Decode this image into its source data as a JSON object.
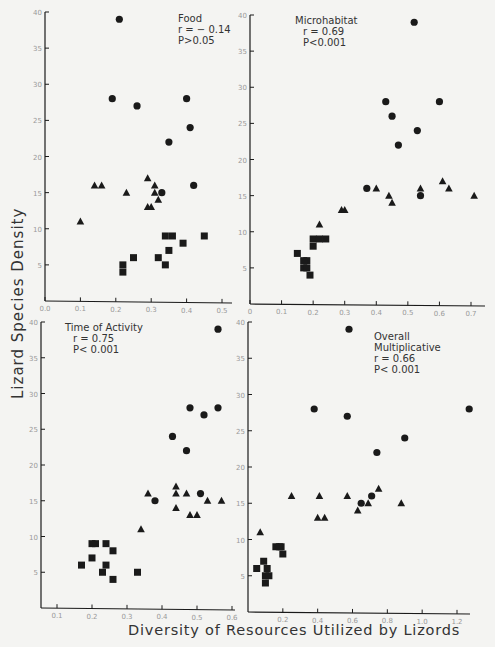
{
  "figure": {
    "ylabel": "Lizard Species Density",
    "xlabel": "Diversity of Resources Utilized by Lizords"
  },
  "chart_data": [
    {
      "type": "scatter",
      "title": "Food",
      "annotation": [
        "Food",
        "r = − 0.14",
        "P>0.05"
      ],
      "xlabel": "Diversity of Resources Utilized by Lizords",
      "ylabel": "Lizard Species Density",
      "xlim": [
        0.0,
        0.52
      ],
      "ylim": [
        0,
        40
      ],
      "xticks": [
        0.0,
        0.1,
        0.2,
        0.3,
        0.4,
        0.5
      ],
      "xtick_labels": [
        "0.0",
        "0.1",
        "0.2",
        "0.3",
        "0.4",
        "0.5"
      ],
      "yticks": [
        5,
        10,
        15,
        20,
        25,
        30,
        35,
        40
      ],
      "px": {
        "x0": 45,
        "x1": 222,
        "xv0": 0.0,
        "xv1": 0.5,
        "y0": 301,
        "y1": 12,
        "yv0": 0,
        "yv1": 40,
        "xend": 232
      },
      "annot_pos": [
        178,
        22
      ],
      "series": [
        {
          "name": "circles",
          "marker": "circle",
          "points": [
            [
              0.21,
              39
            ],
            [
              0.19,
              28
            ],
            [
              0.26,
              27
            ],
            [
              0.4,
              28
            ],
            [
              0.41,
              24
            ],
            [
              0.35,
              22
            ],
            [
              0.42,
              16
            ],
            [
              0.33,
              15
            ]
          ]
        },
        {
          "name": "triangles",
          "marker": "triangle",
          "points": [
            [
              0.1,
              11
            ],
            [
              0.14,
              16
            ],
            [
              0.16,
              16
            ],
            [
              0.23,
              15
            ],
            [
              0.29,
              17
            ],
            [
              0.31,
              16
            ],
            [
              0.31,
              15
            ],
            [
              0.32,
              14
            ],
            [
              0.29,
              13
            ],
            [
              0.3,
              13
            ]
          ]
        },
        {
          "name": "squares",
          "marker": "square",
          "points": [
            [
              0.22,
              5
            ],
            [
              0.22,
              4
            ],
            [
              0.25,
              6
            ],
            [
              0.32,
              6
            ],
            [
              0.34,
              5
            ],
            [
              0.35,
              7
            ],
            [
              0.34,
              9
            ],
            [
              0.36,
              9
            ],
            [
              0.39,
              8
            ],
            [
              0.45,
              9
            ]
          ]
        }
      ]
    },
    {
      "type": "scatter",
      "title": "Microhabitat",
      "annotation": [
        "Microhabitat",
        "r = 0.69",
        "P<0.001"
      ],
      "xlabel": "Diversity of Resources Utilized by Lizords",
      "ylabel": "Lizard Species Density",
      "xlim": [
        0.0,
        0.72
      ],
      "ylim": [
        0,
        40
      ],
      "xticks": [
        0.0,
        0.1,
        0.2,
        0.3,
        0.4,
        0.5,
        0.6,
        0.7
      ],
      "xtick_labels": [
        "0",
        "0.1",
        "0.2",
        "0.3",
        "0.4",
        "0.5",
        "0.6",
        "0.7"
      ],
      "yticks": [
        5,
        10,
        15,
        20,
        25,
        30,
        35,
        40
      ],
      "px": {
        "x0": 250,
        "x1": 471,
        "xv0": 0.0,
        "xv1": 0.7,
        "y0": 304,
        "y1": 15,
        "yv0": 0,
        "yv1": 40,
        "xend": 485
      },
      "annot_pos": [
        295,
        24
      ],
      "series": [
        {
          "name": "circles",
          "marker": "circle",
          "points": [
            [
              0.52,
              39
            ],
            [
              0.43,
              28
            ],
            [
              0.45,
              26
            ],
            [
              0.47,
              22
            ],
            [
              0.53,
              24
            ],
            [
              0.6,
              28
            ],
            [
              0.37,
              16
            ],
            [
              0.54,
              15
            ]
          ]
        },
        {
          "name": "triangles",
          "marker": "triangle",
          "points": [
            [
              0.22,
              11
            ],
            [
              0.29,
              13
            ],
            [
              0.3,
              13
            ],
            [
              0.4,
              16
            ],
            [
              0.44,
              15
            ],
            [
              0.45,
              14
            ],
            [
              0.54,
              16
            ],
            [
              0.61,
              17
            ],
            [
              0.63,
              16
            ],
            [
              0.71,
              15
            ]
          ]
        },
        {
          "name": "squares",
          "marker": "square",
          "points": [
            [
              0.15,
              7
            ],
            [
              0.17,
              5
            ],
            [
              0.18,
              5
            ],
            [
              0.18,
              6
            ],
            [
              0.19,
              4
            ],
            [
              0.2,
              9
            ],
            [
              0.2,
              8
            ],
            [
              0.22,
              9
            ],
            [
              0.24,
              9
            ],
            [
              0.17,
              6
            ]
          ]
        }
      ]
    },
    {
      "type": "scatter",
      "title": "Time of Activity",
      "annotation": [
        "Time of Activity",
        "r = 0.75",
        "P< 0.001"
      ],
      "xlabel": "Diversity of Resources Utilized by Lizords",
      "ylabel": "Lizard Species Density",
      "xlim": [
        0.05,
        0.6
      ],
      "ylim": [
        0,
        40
      ],
      "xticks": [
        0.1,
        0.2,
        0.3,
        0.4,
        0.5,
        0.6
      ],
      "xtick_labels": [
        "0.1",
        "0.2",
        "0.3",
        "0.4",
        "0.5",
        "0.6"
      ],
      "yticks": [
        5,
        10,
        15,
        20,
        25,
        30,
        35,
        40
      ],
      "px": {
        "x0": 57,
        "x1": 232,
        "xv0": 0.1,
        "xv1": 0.6,
        "y0": 608,
        "y1": 322,
        "yv0": 0,
        "yv1": 40,
        "xend": 235,
        "xstart": 41
      },
      "annot_pos": [
        65,
        331
      ],
      "series": [
        {
          "name": "circles",
          "marker": "circle",
          "points": [
            [
              0.56,
              39
            ],
            [
              0.48,
              28
            ],
            [
              0.52,
              27
            ],
            [
              0.56,
              28
            ],
            [
              0.43,
              24
            ],
            [
              0.47,
              22
            ],
            [
              0.38,
              15
            ],
            [
              0.51,
              16
            ]
          ]
        },
        {
          "name": "triangles",
          "marker": "triangle",
          "points": [
            [
              0.34,
              11
            ],
            [
              0.36,
              16
            ],
            [
              0.44,
              17
            ],
            [
              0.44,
              16
            ],
            [
              0.47,
              16
            ],
            [
              0.44,
              14
            ],
            [
              0.48,
              13
            ],
            [
              0.5,
              13
            ],
            [
              0.53,
              15
            ],
            [
              0.57,
              15
            ]
          ]
        },
        {
          "name": "squares",
          "marker": "square",
          "points": [
            [
              0.17,
              6
            ],
            [
              0.2,
              9
            ],
            [
              0.21,
              9
            ],
            [
              0.2,
              7
            ],
            [
              0.24,
              9
            ],
            [
              0.26,
              8
            ],
            [
              0.24,
              6
            ],
            [
              0.23,
              5
            ],
            [
              0.26,
              4
            ],
            [
              0.33,
              5
            ]
          ]
        }
      ]
    },
    {
      "type": "scatter",
      "title": "Overall Multiplicative",
      "annotation": [
        "Overall",
        "Multiplicative",
        "r = 0.66",
        "P< 0.001"
      ],
      "xlabel": "Diversity of Resources Utilized by Lizords",
      "ylabel": "Lizard Species Density",
      "xlim": [
        0.0,
        1.3
      ],
      "ylim": [
        0,
        40
      ],
      "xticks": [
        0.2,
        0.4,
        0.6,
        0.8,
        1.0,
        1.2
      ],
      "xtick_labels": [
        "0.2",
        "0.4",
        "0.6",
        "0.8",
        "1.0",
        "1.2"
      ],
      "yticks": [
        5,
        10,
        15,
        20,
        25,
        30,
        35,
        40
      ],
      "px": {
        "x0": 248,
        "x1": 457,
        "xv0": 0.0,
        "xv1": 1.2,
        "y0": 612,
        "y1": 322,
        "yv0": 0,
        "yv1": 40,
        "xend": 470
      },
      "annot_pos": [
        374,
        340
      ],
      "series": [
        {
          "name": "circles",
          "marker": "circle",
          "points": [
            [
              0.58,
              39
            ],
            [
              0.38,
              28
            ],
            [
              0.57,
              27
            ],
            [
              0.74,
              22
            ],
            [
              0.9,
              24
            ],
            [
              1.27,
              28
            ],
            [
              0.65,
              15
            ],
            [
              0.71,
              16
            ]
          ]
        },
        {
          "name": "triangles",
          "marker": "triangle",
          "points": [
            [
              0.07,
              11
            ],
            [
              0.25,
              16
            ],
            [
              0.41,
              16
            ],
            [
              0.57,
              16
            ],
            [
              0.4,
              13
            ],
            [
              0.44,
              13
            ],
            [
              0.63,
              14
            ],
            [
              0.69,
              15
            ],
            [
              0.75,
              17
            ],
            [
              0.88,
              15
            ]
          ]
        },
        {
          "name": "squares",
          "marker": "square",
          "points": [
            [
              0.05,
              6
            ],
            [
              0.09,
              7
            ],
            [
              0.11,
              6
            ],
            [
              0.1,
              5
            ],
            [
              0.1,
              4
            ],
            [
              0.16,
              9
            ],
            [
              0.19,
              9
            ],
            [
              0.2,
              8
            ],
            [
              0.18,
              9
            ],
            [
              0.12,
              5
            ]
          ]
        }
      ]
    }
  ]
}
